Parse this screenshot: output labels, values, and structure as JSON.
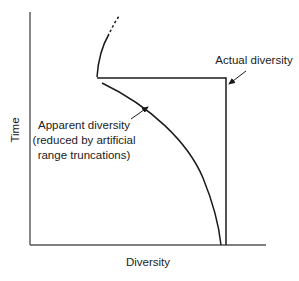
{
  "diagram": {
    "axes": {
      "x_label": "Diversity",
      "y_label": "Time"
    },
    "annotations": {
      "actual": "Actual diversity",
      "apparent_lines": [
        "Apparent diversity",
        "(reduced by artificial",
        "range truncations)"
      ]
    },
    "colors": {
      "line": "#1a1a1a",
      "axis": "#555555",
      "text": "#222222"
    }
  }
}
